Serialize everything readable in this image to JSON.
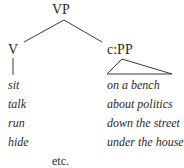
{
  "tree": {
    "root": "VP",
    "children": [
      {
        "label": "V",
        "leaves": [
          "sit",
          "talk",
          "run",
          "hide"
        ]
      },
      {
        "label": "c:PP",
        "leaves": [
          "on a bench",
          "about politics",
          "down the street",
          "under the house"
        ]
      }
    ]
  },
  "footer": "etc."
}
